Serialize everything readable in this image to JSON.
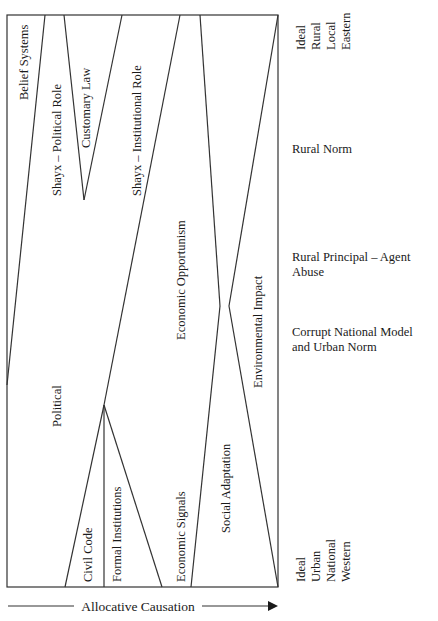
{
  "diagram": {
    "regions": [
      {
        "id": "belief-systems",
        "label": "Belief Systems"
      },
      {
        "id": "shayx-political-role",
        "label": "Shayx – Political Role"
      },
      {
        "id": "customary-law",
        "label": "Customary Law"
      },
      {
        "id": "shayx-institutional-role",
        "label": "Shayx – Institutional Role"
      },
      {
        "id": "political",
        "label": "Political"
      },
      {
        "id": "civil-code",
        "label": "Civil Code"
      },
      {
        "id": "formal-institutions",
        "label": "Formal Institutions"
      },
      {
        "id": "economic-opportunism",
        "label": "Economic Opportunism"
      },
      {
        "id": "economic-signals",
        "label": "Economic Signals"
      },
      {
        "id": "social-adaptation",
        "label": "Social Adaptation"
      },
      {
        "id": "environmental-impact",
        "label": "Environmental Impact"
      }
    ],
    "top_pole": [
      "Ideal",
      "Rural",
      "Local",
      "Eastern"
    ],
    "bottom_pole": [
      "Ideal",
      "Urban",
      "National",
      "Western"
    ],
    "levels": [
      {
        "label_lines": [
          "Rural Norm"
        ]
      },
      {
        "label_lines": [
          "Rural Principal – Agent",
          "Abuse"
        ]
      },
      {
        "label_lines": [
          "Corrupt National Model",
          "and Urban Norm"
        ]
      }
    ],
    "axis": {
      "label": "Allocative Causation"
    }
  }
}
